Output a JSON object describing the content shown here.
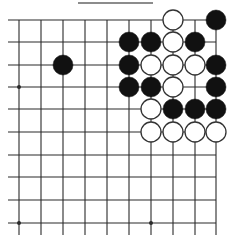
{
  "board": {
    "columns": 10,
    "rows": 10,
    "x_lines": [
      19,
      41,
      63,
      85,
      107,
      129,
      151,
      173,
      195,
      216
    ],
    "y_lines": [
      20,
      42,
      65,
      87,
      109,
      132,
      155,
      177,
      200,
      223
    ],
    "line_color": "#2a2a2a",
    "top_edge_bar": {
      "x1": 78,
      "x2": 153,
      "y": 3
    },
    "star_points": [
      [
        0,
        3
      ],
      [
        0,
        9
      ],
      [
        6,
        9
      ]
    ],
    "stone_radius": 10,
    "colors": {
      "black": "#111111",
      "white": "#ffffff",
      "white_stroke": "#333333"
    }
  },
  "stones": [
    {
      "color": "white",
      "col": 7,
      "row": 0
    },
    {
      "color": "black",
      "col": 9,
      "row": 0
    },
    {
      "color": "black",
      "col": 5,
      "row": 1
    },
    {
      "color": "black",
      "col": 6,
      "row": 1
    },
    {
      "color": "white",
      "col": 7,
      "row": 1
    },
    {
      "color": "black",
      "col": 8,
      "row": 1
    },
    {
      "color": "black",
      "col": 2,
      "row": 2
    },
    {
      "color": "black",
      "col": 5,
      "row": 2
    },
    {
      "color": "white",
      "col": 6,
      "row": 2
    },
    {
      "color": "white",
      "col": 7,
      "row": 2
    },
    {
      "color": "white",
      "col": 8,
      "row": 2
    },
    {
      "color": "black",
      "col": 9,
      "row": 2
    },
    {
      "color": "black",
      "col": 5,
      "row": 3
    },
    {
      "color": "black",
      "col": 6,
      "row": 3
    },
    {
      "color": "white",
      "col": 7,
      "row": 3
    },
    {
      "color": "black",
      "col": 9,
      "row": 3
    },
    {
      "color": "white",
      "col": 6,
      "row": 4
    },
    {
      "color": "black",
      "col": 7,
      "row": 4
    },
    {
      "color": "black",
      "col": 8,
      "row": 4
    },
    {
      "color": "black",
      "col": 9,
      "row": 4
    },
    {
      "color": "white",
      "col": 6,
      "row": 5
    },
    {
      "color": "white",
      "col": 7,
      "row": 5
    },
    {
      "color": "white",
      "col": 8,
      "row": 5
    },
    {
      "color": "white",
      "col": 9,
      "row": 5
    }
  ]
}
